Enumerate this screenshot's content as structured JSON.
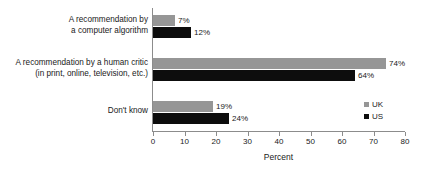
{
  "chart_data": {
    "type": "bar",
    "orientation": "horizontal",
    "title": "",
    "xlabel": "Percent",
    "ylabel": "",
    "xlim": [
      0,
      80
    ],
    "xticks": [
      0,
      10,
      20,
      30,
      40,
      50,
      60,
      70,
      80
    ],
    "xtick_labels": [
      "0",
      "10",
      "20",
      "30",
      "40",
      "50",
      "60",
      "70",
      "80"
    ],
    "grid": false,
    "legend_position": "bottom-right",
    "categories": [
      [
        "A recommendation by",
        "a computer algorithm"
      ],
      [
        "A recommendation by a human critic",
        "(in print, online, television, etc.)"
      ],
      [
        "Don't know"
      ]
    ],
    "series": [
      {
        "name": "UK",
        "color": "#969696",
        "values": [
          7,
          74,
          19
        ],
        "value_labels": [
          "7%",
          "74%",
          "19%"
        ]
      },
      {
        "name": "US",
        "color": "#0d0d0d",
        "values": [
          12,
          64,
          24
        ],
        "value_labels": [
          "12%",
          "64%",
          "24%"
        ]
      }
    ]
  },
  "legend": {
    "items": [
      {
        "label": "UK",
        "color": "#969696"
      },
      {
        "label": "US",
        "color": "#0d0d0d"
      }
    ]
  },
  "axis": {
    "x_title": "Percent",
    "ticks": [
      "0",
      "10",
      "20",
      "30",
      "40",
      "50",
      "60",
      "70",
      "80"
    ]
  },
  "groups": [
    {
      "label_line1": "A recommendation by",
      "label_line2": "a computer algorithm",
      "uk_label": "7%",
      "us_label": "12%"
    },
    {
      "label_line1": "A recommendation by a human critic",
      "label_line2": "(in print, online, television, etc.)",
      "uk_label": "74%",
      "us_label": "64%"
    },
    {
      "label_line1": "Don't know",
      "label_line2": "",
      "uk_label": "19%",
      "us_label": "24%"
    }
  ]
}
